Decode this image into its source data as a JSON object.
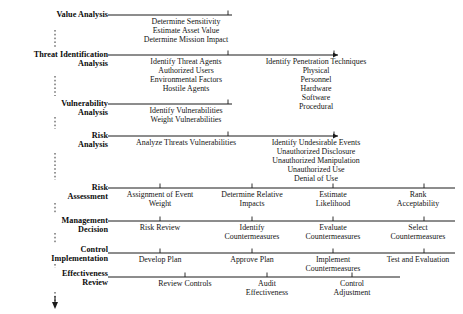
{
  "diagram": {
    "orientation": "top-to-bottom",
    "spine": {
      "connector_style": "dotted-vertical",
      "terminator": "down-arrow",
      "x": 55
    },
    "stages": [
      {
        "id": "value-analysis",
        "label": "Value Analysis",
        "line_y": 15,
        "line_x1": 108,
        "line_x2": 232,
        "arrowhead": false,
        "columns": [
          {
            "tick_x": 228,
            "text_center": 186,
            "text": "Determine Sensitivity\nEstimate Asset Value\nDetermine Mission Impact"
          }
        ]
      },
      {
        "id": "threat-identification-analysis",
        "label": "Threat Identification\nAnalysis",
        "line_y": 55,
        "line_x1": 108,
        "line_x2": 338,
        "arrowhead": true,
        "columns": [
          {
            "tick_x": 228,
            "text_center": 186,
            "text": "Identify Threat Agents\nAuthorized Users\nEnvironmental Factors\nHostile Agents"
          },
          {
            "tick_x": 334,
            "text_center": 316,
            "text": "Identify Penetration Techniques\nPhysical\nPersonnel\nHardware\nSoftware\nProcedural"
          }
        ]
      },
      {
        "id": "vulnerability-analysis",
        "label": "Vulnerability\nAnalysis",
        "line_y": 104,
        "line_x1": 108,
        "line_x2": 232,
        "arrowhead": false,
        "columns": [
          {
            "tick_x": 228,
            "text_center": 186,
            "text": "Identify Vulnerabilities\nWeight Vulnerabilities"
          }
        ]
      },
      {
        "id": "risk-analysis",
        "label": "Risk\nAnalysis",
        "line_y": 136,
        "line_x1": 108,
        "line_x2": 338,
        "arrowhead": true,
        "columns": [
          {
            "tick_x": 228,
            "text_center": 186,
            "text": "Analyze Threats Vulnerabilities"
          },
          {
            "tick_x": 334,
            "text_center": 316,
            "text": "Identify Undesirable Events\nUnauthorized Disclosure\nUnauthorized Manipulation\nUnauthorized Use\nDenial of Use"
          }
        ]
      },
      {
        "id": "risk-assessment",
        "label": "Risk\nAssessment",
        "line_y": 188,
        "line_x1": 108,
        "line_x2": 455,
        "arrowhead": false,
        "columns": [
          {
            "tick_x": 160,
            "text_center": 160,
            "text": "Assignment of Event\nWeight"
          },
          {
            "tick_x": 252,
            "text_center": 252,
            "text": "Determine Relative\nImpacts"
          },
          {
            "tick_x": 333,
            "text_center": 333,
            "text": "Estimate\nLikelihood"
          },
          {
            "tick_x": 424,
            "text_center": 418,
            "text": "Rank\nAcceptability"
          }
        ]
      },
      {
        "id": "management-decision",
        "label": "Management\nDecision",
        "line_y": 221,
        "line_x1": 108,
        "line_x2": 455,
        "arrowhead": false,
        "columns": [
          {
            "tick_x": 160,
            "text_center": 160,
            "text": "Risk Review"
          },
          {
            "tick_x": 252,
            "text_center": 252,
            "text": "Identify\nCountermeasures"
          },
          {
            "tick_x": 333,
            "text_center": 333,
            "text": "Evaluate\nCountermeasures"
          },
          {
            "tick_x": 424,
            "text_center": 418,
            "text": "Select\nCountermeasures"
          }
        ]
      },
      {
        "id": "control-implementation",
        "label": "Control\nImplementation",
        "line_y": 253,
        "line_x1": 108,
        "line_x2": 455,
        "arrowhead": false,
        "columns": [
          {
            "tick_x": 160,
            "text_center": 160,
            "text": "Develop Plan"
          },
          {
            "tick_x": 252,
            "text_center": 252,
            "text": "Approve Plan"
          },
          {
            "tick_x": 333,
            "text_center": 333,
            "text": "Implement\nCountermeasures"
          },
          {
            "tick_x": 424,
            "text_center": 418,
            "text": "Test and Evaluation"
          }
        ]
      },
      {
        "id": "effectiveness-review",
        "label": "Effectiveness\nReview",
        "line_y": 277,
        "line_x1": 108,
        "line_x2": 400,
        "arrowhead": false,
        "columns": [
          {
            "tick_x": 185,
            "text_center": 185,
            "text": "Review Controls"
          },
          {
            "tick_x": 267,
            "text_center": 267,
            "text": "Audit\nEffectiveness"
          },
          {
            "tick_x": 352,
            "text_center": 352,
            "text": "Control\nAdjustment"
          }
        ]
      }
    ],
    "stage_label_positions": [
      {
        "id": "value-analysis",
        "top": 10
      },
      {
        "id": "threat-identification-analysis",
        "top": 50
      },
      {
        "id": "vulnerability-analysis",
        "top": 99
      },
      {
        "id": "risk-analysis",
        "top": 131
      },
      {
        "id": "risk-assessment",
        "top": 183
      },
      {
        "id": "management-decision",
        "top": 216
      },
      {
        "id": "control-implementation",
        "top": 245
      },
      {
        "id": "effectiveness-review",
        "top": 269
      }
    ],
    "colors": {
      "line": "#1a1a1a",
      "text": "#111111",
      "background": "#ffffff"
    }
  }
}
